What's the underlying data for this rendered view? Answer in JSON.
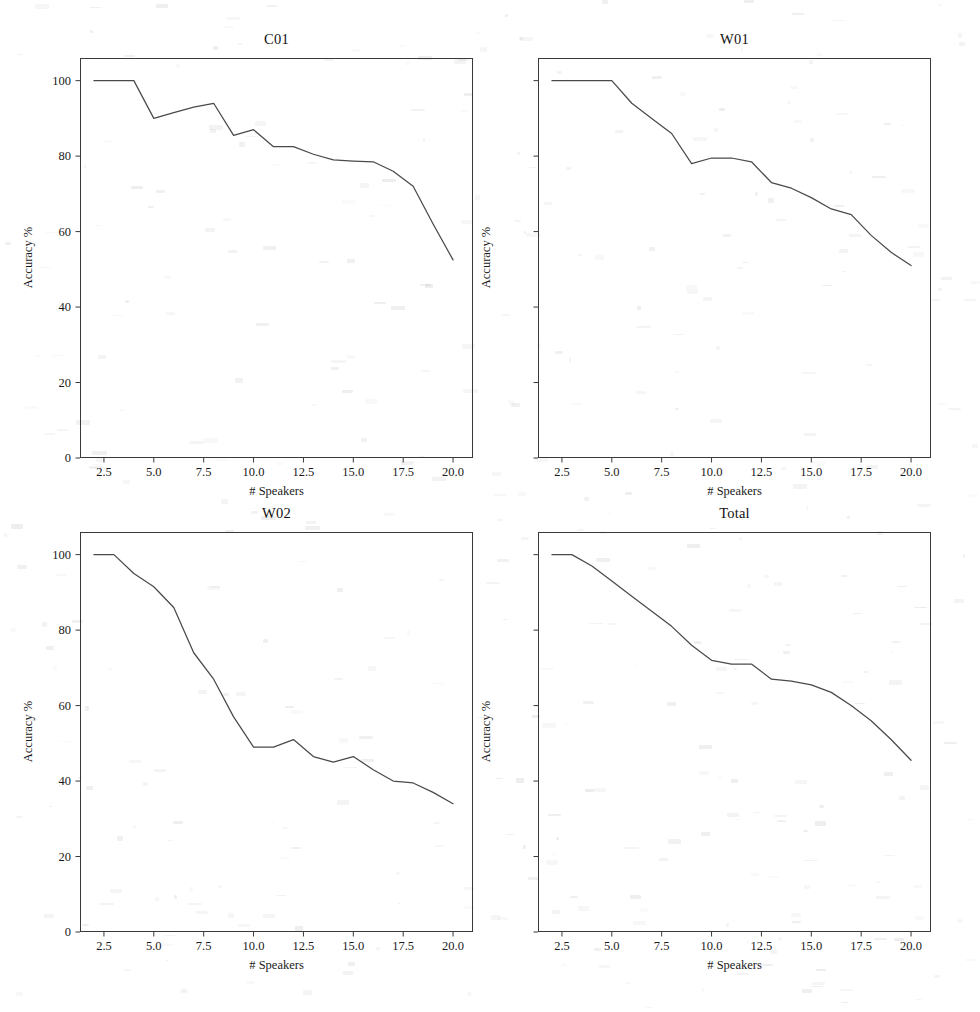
{
  "figure": {
    "background_color": "#ffffff",
    "line_color": "#4a4a4a",
    "axis_color": "#3a3a3a",
    "width": 980,
    "height": 1012
  },
  "chart_data": [
    {
      "type": "line",
      "title": "C01",
      "xlabel": "# Speakers",
      "ylabel": "Accuracy %",
      "xlim": [
        1.3,
        21.0
      ],
      "ylim": [
        0,
        106
      ],
      "grid": false,
      "legend": "none",
      "xticks": [
        2.5,
        5.0,
        7.5,
        10.0,
        12.5,
        15.0,
        17.5,
        20.0
      ],
      "xtick_labels": [
        "2.5",
        "5.0",
        "7.5",
        "10.0",
        "12.5",
        "15.0",
        "17.5",
        "20.0"
      ],
      "yticks": [
        0,
        20,
        40,
        60,
        80,
        100
      ],
      "ytick_labels": [
        "0",
        "20",
        "40",
        "60",
        "80",
        "100"
      ],
      "show_ytick_labels": true,
      "x": [
        2,
        3,
        4,
        5,
        6,
        7,
        8,
        9,
        10,
        11,
        12,
        13,
        14,
        15,
        16,
        17,
        18,
        19,
        20
      ],
      "values": [
        100,
        100,
        100,
        90,
        91.5,
        93,
        94,
        85.5,
        87,
        82.5,
        82.5,
        80.5,
        79,
        78.7,
        78.5,
        76,
        72,
        62,
        52.5
      ]
    },
    {
      "type": "line",
      "title": "W01",
      "xlabel": "# Speakers",
      "ylabel": "Accuracy %",
      "xlim": [
        1.3,
        21.0
      ],
      "ylim": [
        0,
        106
      ],
      "grid": false,
      "legend": "none",
      "xticks": [
        2.5,
        5.0,
        7.5,
        10.0,
        12.5,
        15.0,
        17.5,
        20.0
      ],
      "xtick_labels": [
        "2.5",
        "5.0",
        "7.5",
        "10.0",
        "12.5",
        "15.0",
        "17.5",
        "20.0"
      ],
      "yticks": [
        0,
        20,
        40,
        60,
        80,
        100
      ],
      "ytick_labels": [
        "",
        "",
        "",
        "",
        "",
        ""
      ],
      "show_ytick_labels": false,
      "x": [
        2,
        3,
        4,
        5,
        6,
        7,
        8,
        9,
        10,
        11,
        12,
        13,
        14,
        15,
        16,
        17,
        18,
        19,
        20
      ],
      "values": [
        100,
        100,
        100,
        100,
        94,
        90,
        86,
        78,
        79.5,
        79.5,
        78.5,
        73,
        71.5,
        69,
        66,
        64.5,
        59,
        54.5,
        51
      ]
    },
    {
      "type": "line",
      "title": "W02",
      "xlabel": "# Speakers",
      "ylabel": "Accuracy %",
      "xlim": [
        1.3,
        21.0
      ],
      "ylim": [
        0,
        106
      ],
      "grid": false,
      "legend": "none",
      "xticks": [
        2.5,
        5.0,
        7.5,
        10.0,
        12.5,
        15.0,
        17.5,
        20.0
      ],
      "xtick_labels": [
        "2.5",
        "5.0",
        "7.5",
        "10.0",
        "12.5",
        "15.0",
        "17.5",
        "20.0"
      ],
      "yticks": [
        0,
        20,
        40,
        60,
        80,
        100
      ],
      "ytick_labels": [
        "0",
        "20",
        "40",
        "60",
        "80",
        "100"
      ],
      "show_ytick_labels": true,
      "x": [
        2,
        3,
        4,
        5,
        6,
        7,
        8,
        9,
        10,
        11,
        12,
        13,
        14,
        15,
        16,
        17,
        18,
        19,
        20
      ],
      "values": [
        100,
        100,
        95,
        91.5,
        86,
        74,
        67,
        57,
        49,
        49,
        51,
        46.5,
        45,
        46.5,
        43,
        40,
        39.5,
        37,
        34
      ]
    },
    {
      "type": "line",
      "title": "Total",
      "xlabel": "# Speakers",
      "ylabel": "Accuracy %",
      "xlim": [
        1.3,
        21.0
      ],
      "ylim": [
        0,
        106
      ],
      "grid": false,
      "legend": "none",
      "xticks": [
        2.5,
        5.0,
        7.5,
        10.0,
        12.5,
        15.0,
        17.5,
        20.0
      ],
      "xtick_labels": [
        "2.5",
        "5.0",
        "7.5",
        "10.0",
        "12.5",
        "15.0",
        "17.5",
        "20.0"
      ],
      "yticks": [
        0,
        20,
        40,
        60,
        80,
        100
      ],
      "ytick_labels": [
        "",
        "",
        "",
        "",
        "",
        ""
      ],
      "show_ytick_labels": false,
      "x": [
        2,
        3,
        4,
        5,
        6,
        7,
        8,
        9,
        10,
        11,
        12,
        13,
        14,
        15,
        16,
        17,
        18,
        19,
        20
      ],
      "values": [
        100,
        100,
        97,
        93,
        89,
        85,
        81,
        76,
        72,
        71,
        71,
        67,
        66.5,
        65.5,
        63.5,
        60,
        56,
        51,
        45.5
      ]
    }
  ],
  "panels": [
    {
      "key": "c01",
      "left": 80,
      "top": 58,
      "width": 393,
      "height": 400
    },
    {
      "key": "w01",
      "left": 538,
      "top": 58,
      "width": 393,
      "height": 400
    },
    {
      "key": "w02",
      "left": 80,
      "top": 532,
      "width": 393,
      "height": 400
    },
    {
      "key": "total",
      "left": 538,
      "top": 532,
      "width": 393,
      "height": 400
    }
  ]
}
